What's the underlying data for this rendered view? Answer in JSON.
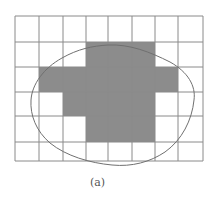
{
  "figure": {
    "caption": "(a)",
    "grid": {
      "cols": 8,
      "rows": 6,
      "x_lines": [
        15,
        39,
        63,
        86,
        108,
        132,
        155,
        178,
        203
      ],
      "y_lines": [
        16,
        42,
        67,
        92,
        116,
        142,
        161
      ],
      "line_color": "#8a8a8a",
      "shade_color": "#8c8c8c"
    },
    "shaded_cells": [
      [
        1,
        3
      ],
      [
        1,
        4
      ],
      [
        1,
        5
      ],
      [
        2,
        1
      ],
      [
        2,
        2
      ],
      [
        2,
        3
      ],
      [
        2,
        4
      ],
      [
        2,
        5
      ],
      [
        2,
        6
      ],
      [
        3,
        2
      ],
      [
        3,
        3
      ],
      [
        3,
        4
      ],
      [
        3,
        5
      ],
      [
        4,
        3
      ],
      [
        4,
        4
      ],
      [
        4,
        5
      ]
    ],
    "curve": {
      "color": "#707070",
      "path": "M108,45 C130,44 150,52 170,62 C188,72 196,86 194,100 C192,120 182,140 165,152 C150,162 132,167 112,165 C90,163 66,156 50,143 C36,131 30,115 31,100 C32,84 44,68 62,58 C78,49 92,46 108,45 Z"
    }
  }
}
